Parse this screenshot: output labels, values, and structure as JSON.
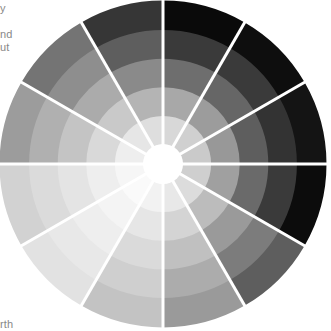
{
  "text_fragments": [
    {
      "text": "y",
      "x": 0,
      "y": 2
    },
    {
      "text": "nd",
      "x": 0,
      "y": 28
    },
    {
      "text": "ut",
      "x": 0,
      "y": 40
    },
    {
      "text": "rth",
      "x": 0,
      "y": 318
    }
  ],
  "wheel": {
    "cx": 163,
    "cy": 164,
    "outer_radius": 163,
    "center_radius": 20,
    "ring_count": 5,
    "segment_count": 12,
    "divider_color": "#ffffff",
    "divider_width": 3,
    "center_color": "#ffffff",
    "segments": [
      {
        "label": "segment-1",
        "start_deg": 0,
        "rings": [
          "#d8d8d8",
          "#a8a8a8",
          "#6e6e6e",
          "#3a3a3a",
          "#0a0a0a"
        ]
      },
      {
        "label": "segment-2",
        "start_deg": 30,
        "rings": [
          "#d0d0d0",
          "#9c9c9c",
          "#666666",
          "#3a3a3a",
          "#0e0e0e"
        ]
      },
      {
        "label": "segment-3",
        "start_deg": 60,
        "rings": [
          "#cacaca",
          "#989898",
          "#5e5e5e",
          "#333333",
          "#141414"
        ]
      },
      {
        "label": "segment-4",
        "start_deg": 90,
        "rings": [
          "#cfcfcf",
          "#a0a0a0",
          "#6a6a6a",
          "#3a3a3a",
          "#0c0c0c"
        ]
      },
      {
        "label": "segment-5",
        "start_deg": 120,
        "rings": [
          "#dcdcdc",
          "#bcbcbc",
          "#9a9a9a",
          "#7c7c7c",
          "#5e5e5e"
        ]
      },
      {
        "label": "segment-6",
        "start_deg": 150,
        "rings": [
          "#e8e8e8",
          "#d4d4d4",
          "#c0c0c0",
          "#acacac",
          "#9a9a9a"
        ]
      },
      {
        "label": "segment-7",
        "start_deg": 180,
        "rings": [
          "#f2f2f2",
          "#e6e6e6",
          "#dadada",
          "#cfcfcf",
          "#c3c3c3"
        ]
      },
      {
        "label": "segment-8",
        "start_deg": 210,
        "rings": [
          "#fafafa",
          "#f4f4f4",
          "#eeeeee",
          "#e8e8e8",
          "#e2e2e2"
        ]
      },
      {
        "label": "segment-9",
        "start_deg": 240,
        "rings": [
          "#f6f6f6",
          "#eeeeee",
          "#e4e4e4",
          "#dbdbdb",
          "#d2d2d2"
        ]
      },
      {
        "label": "segment-10",
        "start_deg": 270,
        "rings": [
          "#eeeeee",
          "#d9d9d9",
          "#c4c4c4",
          "#b0b0b0",
          "#9c9c9c"
        ]
      },
      {
        "label": "segment-11",
        "start_deg": 300,
        "rings": [
          "#e6e6e6",
          "#c9c9c9",
          "#ababab",
          "#8e8e8e",
          "#747474"
        ]
      },
      {
        "label": "segment-12",
        "start_deg": 330,
        "rings": [
          "#dedede",
          "#b4b4b4",
          "#8a8a8a",
          "#5e5e5e",
          "#363636"
        ]
      }
    ]
  }
}
